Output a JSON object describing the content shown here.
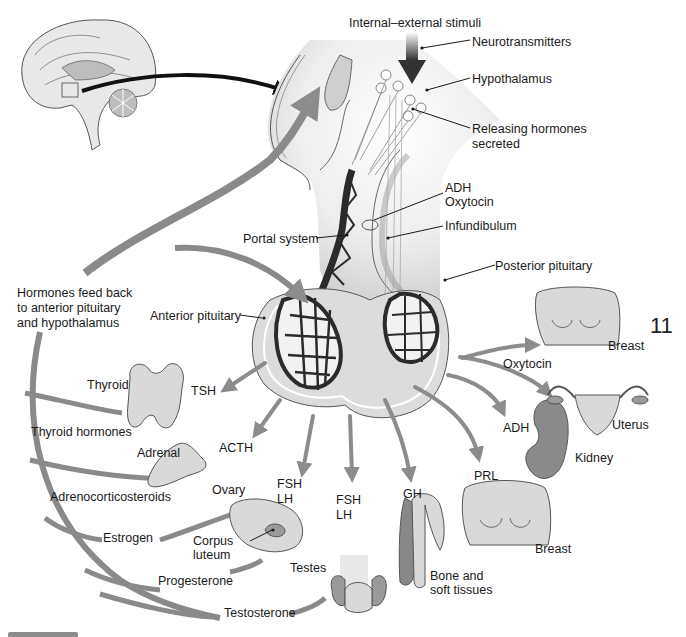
{
  "figure": {
    "page_number": "11"
  },
  "labels": {
    "stimuli": "Internal–external stimuli",
    "neurotransmitters": "Neurotransmitters",
    "hypothalamus": "Hypothalamus",
    "releasing_hormones_line1": "Releasing hormones",
    "releasing_hormones_line2": "secreted",
    "adh_top": "ADH",
    "oxytocin_top": "Oxytocin",
    "infundibulum": "Infundibulum",
    "portal_system": "Portal system",
    "posterior_pituitary": "Posterior pituitary",
    "anterior_pituitary": "Anterior pituitary",
    "feedback_line1": "Hormones feed back",
    "feedback_line2": "to anterior pituitary",
    "feedback_line3": "and hypothalamus"
  },
  "hormones": {
    "tsh": "TSH",
    "acth": "ACTH",
    "fsh_lh_1_a": "FSH",
    "fsh_lh_1_b": "LH",
    "fsh_lh_2_a": "FSH",
    "fsh_lh_2_b": "LH",
    "gh": "GH",
    "prl": "PRL",
    "adh": "ADH",
    "oxytocin": "Oxytocin"
  },
  "organs": {
    "thyroid": "Thyroid",
    "adrenal": "Adrenal",
    "ovary": "Ovary",
    "corpus_luteum_1": "Corpus",
    "corpus_luteum_2": "luteum",
    "testes": "Testes",
    "bone_1": "Bone and",
    "bone_2": "soft tissues",
    "breast_prl": "Breast",
    "kidney": "Kidney",
    "uterus": "Uterus",
    "breast_oxytocin": "Breast"
  },
  "feedback_hormones": {
    "thyroid": "Thyroid hormones",
    "adrenal": "Adrenocorticosteroids",
    "estrogen": "Estrogen",
    "progesterone": "Progesterone",
    "testosterone": "Testosterone"
  },
  "colors": {
    "arrow_gray": "#8c8c8c",
    "tissue_light": "#e6e6e6",
    "vessel_dark": "#2b2b2b",
    "organ_fill": "#d9d9d9"
  }
}
